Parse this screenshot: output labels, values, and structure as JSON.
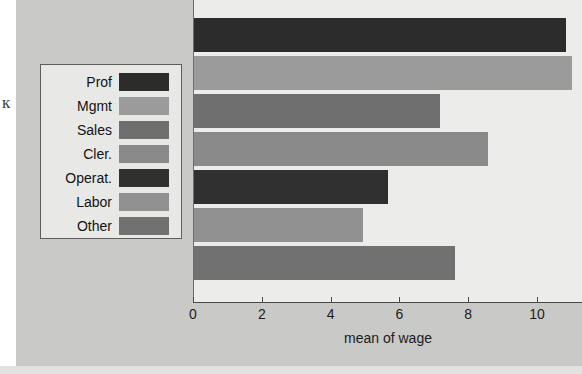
{
  "chart_data": {
    "type": "bar",
    "orientation": "horizontal",
    "title": "",
    "xlabel": "mean of wage",
    "ylabel": "",
    "categories": [
      "Prof",
      "Mgmt",
      "Sales",
      "Cler.",
      "Operat.",
      "Labor",
      "Other"
    ],
    "values": [
      10.8,
      11.0,
      7.15,
      8.55,
      5.65,
      4.9,
      7.6
    ],
    "xlim": [
      0,
      11.3
    ],
    "xticks": [
      0,
      2,
      4,
      6,
      8,
      10
    ],
    "xtick_labels": [
      "0",
      "2",
      "4",
      "6",
      "8",
      "10"
    ],
    "grid": false,
    "legend_position": "left-outside",
    "series": [
      {
        "name": "occupation",
        "values": [
          10.8,
          11.0,
          7.15,
          8.55,
          5.65,
          4.9,
          7.6
        ]
      }
    ],
    "bar_colors": [
      "#2c2c2c",
      "#9b9b9b",
      "#6f6f6f",
      "#8a8a8a",
      "#303030",
      "#919191",
      "#717171"
    ]
  },
  "axis": {
    "x_title": "mean of wage",
    "ticks": [
      {
        "label": "0",
        "value": 0
      },
      {
        "label": "2",
        "value": 2
      },
      {
        "label": "4",
        "value": 4
      },
      {
        "label": "6",
        "value": 6
      },
      {
        "label": "8",
        "value": 8
      },
      {
        "label": "10",
        "value": 10
      }
    ]
  },
  "legend": {
    "items": [
      {
        "label": "Prof",
        "color": "#2c2c2c"
      },
      {
        "label": "Mgmt",
        "color": "#9b9b9b"
      },
      {
        "label": "Sales",
        "color": "#6f6f6f"
      },
      {
        "label": "Cler.",
        "color": "#8a8a8a"
      },
      {
        "label": "Operat.",
        "color": "#303030"
      },
      {
        "label": "Labor",
        "color": "#919191"
      },
      {
        "label": "Other",
        "color": "#717171"
      }
    ]
  },
  "page": {
    "background_color": "#c9c9c7",
    "plot_background_color": "#ececeb",
    "edge_glyph": "к"
  }
}
